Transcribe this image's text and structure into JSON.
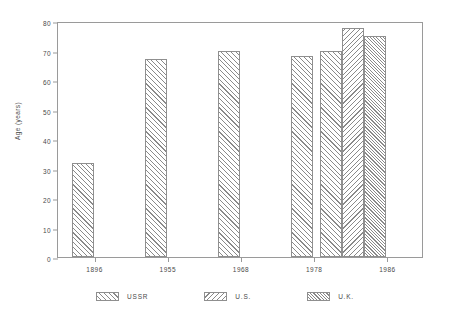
{
  "chart_data": {
    "type": "bar",
    "title": "",
    "subtitle": "",
    "xlabel": "",
    "ylabel": "Age (years)",
    "ylim": [
      0,
      80
    ],
    "yticks": [
      0,
      10,
      20,
      30,
      40,
      50,
      60,
      70,
      80
    ],
    "grid": false,
    "legend_position": "bottom",
    "categories": [
      "1896",
      "1955",
      "1968",
      "1978",
      "1986"
    ],
    "series": [
      {
        "name": "USSR",
        "hatch": "forward-diagonal",
        "values": [
          32,
          67,
          70,
          68,
          70
        ]
      },
      {
        "name": "U.S.",
        "hatch": "backward-diagonal",
        "values": [
          null,
          null,
          null,
          null,
          77.5
        ]
      },
      {
        "name": "U.K.",
        "hatch": "dense-diagonal",
        "values": [
          null,
          null,
          null,
          null,
          75
        ]
      }
    ],
    "bars": [
      {
        "group": "1896",
        "series": "USSR",
        "value": 32,
        "hatch": "forward-diagonal"
      },
      {
        "group": "1955",
        "series": "USSR",
        "value": 67,
        "hatch": "forward-diagonal"
      },
      {
        "group": "1968",
        "series": "USSR",
        "value": 70,
        "hatch": "forward-diagonal"
      },
      {
        "group": "1978",
        "series": "USSR",
        "value": 68,
        "hatch": "forward-diagonal"
      },
      {
        "group": "1986",
        "series": "USSR",
        "value": 70,
        "hatch": "forward-diagonal"
      },
      {
        "group": "1986",
        "series": "U.S.",
        "value": 77.5,
        "hatch": "backward-diagonal"
      },
      {
        "group": "1986",
        "series": "U.K.",
        "value": 75,
        "hatch": "dense-diagonal"
      }
    ],
    "legend": [
      {
        "label": "USSR",
        "hatch": "forward-diagonal"
      },
      {
        "label": "U.S.",
        "hatch": "backward-diagonal"
      },
      {
        "label": "U.K.",
        "hatch": "dense-diagonal"
      }
    ],
    "colors": {
      "background": "#ffffff",
      "axis": "#9a9a9a",
      "bar_outline": "#8f8f8f",
      "hatch": "#8a8a8a",
      "text": "#4a4a4a"
    }
  }
}
